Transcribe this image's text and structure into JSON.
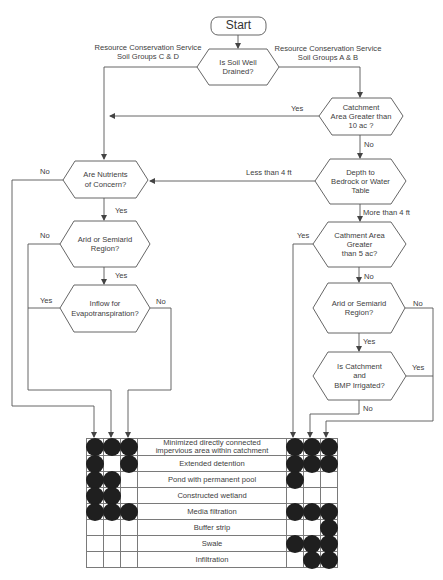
{
  "diagram": {
    "type": "flowchart",
    "start": "Start",
    "nodes": {
      "soil_drained": "Is Soil Well Drained?",
      "catchment_10": "Catchment Area Greater than 10 ac ?",
      "depth": "Depth to Bedrock or Water Table",
      "nutrients": "Are  Nutrients of Concern?",
      "arid_left": "Arid or Semiarid Region?",
      "inflow": "Inflow for Evapotranspiration?",
      "catchment_5": "Cathment Area Greater than 5 ac?",
      "arid_right": "Arid or Semiarid Region?",
      "irrigated": "Is Catchment and BMP Irrigated?"
    },
    "node_lines": {
      "soil_drained": [
        "Is Soil Well",
        "Drained?"
      ],
      "catchment_10": [
        "Catchment",
        "Area Greater than",
        "10 ac ?"
      ],
      "depth": [
        "Depth to",
        "Bedrock or Water",
        "Table"
      ],
      "nutrients": [
        "Are  Nutrients",
        "of Concern?"
      ],
      "arid_left": [
        "Arid or Semiarid",
        "Region?"
      ],
      "inflow": [
        "Inflow for",
        "Evapotranspiration?"
      ],
      "catchment_5": [
        "Cathment Area",
        "Greater",
        "than 5 ac?"
      ],
      "arid_right": [
        "Arid or Semiarid",
        "Region?"
      ],
      "irrigated": [
        "Is Catchment",
        "and",
        "BMP Irrigated?"
      ]
    },
    "edge_labels": {
      "soil_cd": [
        "Resource Conservation Service",
        "Soil Groups C & D"
      ],
      "soil_ab": [
        "Resource Conservation Service",
        "Soil Groups A & B"
      ],
      "catchment10_yes": "Yes",
      "catchment10_no": "No",
      "depth_less": "Less than 4 ft",
      "depth_more": "More than 4 ft",
      "nutrients_no": "No",
      "nutrients_yes": "Yes",
      "aridL_no": "No",
      "aridL_yes": "Yes",
      "inflow_yes": "Yes",
      "inflow_no": "No",
      "catchment5_yes": "Yes",
      "catchment5_no": "No",
      "aridR_no": "No",
      "aridR_yes": "Yes",
      "irrigated_yes": "Yes",
      "irrigated_no": "No"
    },
    "bmp_table": {
      "rows": [
        {
          "label_lines": [
            "Minimized directly connected",
            "impervious area within catchment"
          ],
          "left": [
            1,
            1,
            1
          ],
          "right": [
            1,
            1,
            1
          ]
        },
        {
          "label_lines": [
            "Extended detention"
          ],
          "left": [
            1,
            0,
            1
          ],
          "right": [
            1,
            1,
            1
          ]
        },
        {
          "label_lines": [
            "Pond with permanent pool"
          ],
          "left": [
            1,
            1,
            0
          ],
          "right": [
            1,
            0,
            0
          ]
        },
        {
          "label_lines": [
            "Constructed wetland"
          ],
          "left": [
            1,
            1,
            0
          ],
          "right": [
            0,
            0,
            0
          ]
        },
        {
          "label_lines": [
            "Media filtration"
          ],
          "left": [
            1,
            1,
            1
          ],
          "right": [
            1,
            1,
            1
          ]
        },
        {
          "label_lines": [
            "Buffer strip"
          ],
          "left": [
            0,
            0,
            0
          ],
          "right": [
            0,
            0,
            1
          ]
        },
        {
          "label_lines": [
            "Swale"
          ],
          "left": [
            0,
            0,
            0
          ],
          "right": [
            1,
            1,
            1
          ]
        },
        {
          "label_lines": [
            "Infiltration"
          ],
          "left": [
            0,
            0,
            0
          ],
          "right": [
            0,
            1,
            1
          ]
        }
      ]
    }
  }
}
